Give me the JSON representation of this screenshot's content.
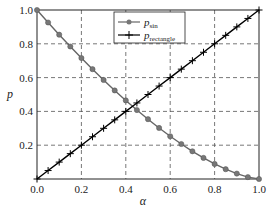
{
  "chart_data": {
    "type": "line",
    "title": "",
    "xlabel": "α",
    "ylabel": "p",
    "xlim": [
      0,
      1
    ],
    "ylim": [
      0,
      1
    ],
    "grid": true,
    "legend_position": "upper center",
    "xticks": [
      "0.0",
      "0.2",
      "0.4",
      "0.6",
      "0.8",
      "1.0"
    ],
    "yticks": [
      "0.2",
      "0.4",
      "0.6",
      "0.8",
      "1.0"
    ],
    "x": [
      0,
      0.05,
      0.1,
      0.15,
      0.2,
      0.25,
      0.3,
      0.35,
      0.4,
      0.45,
      0.5,
      0.55,
      0.6,
      0.65,
      0.7,
      0.75,
      0.8,
      0.85,
      0.9,
      0.95,
      1.0
    ],
    "series": [
      {
        "name": "p_sin",
        "label_main": "p",
        "label_sub": "sin",
        "marker": "asterisk-dot",
        "color": "#666666",
        "values": [
          1.0,
          0.926,
          0.854,
          0.784,
          0.716,
          0.65,
          0.586,
          0.524,
          0.465,
          0.408,
          0.354,
          0.302,
          0.253,
          0.207,
          0.164,
          0.125,
          0.089,
          0.058,
          0.032,
          0.011,
          0.0
        ]
      },
      {
        "name": "p_rectangle",
        "label_main": "p",
        "label_sub": "rectangle",
        "marker": "plus",
        "color": "#000000",
        "values": [
          0.0,
          0.05,
          0.1,
          0.15,
          0.2,
          0.25,
          0.3,
          0.35,
          0.4,
          0.45,
          0.5,
          0.55,
          0.6,
          0.65,
          0.7,
          0.75,
          0.8,
          0.85,
          0.9,
          0.95,
          1.0
        ]
      }
    ]
  }
}
